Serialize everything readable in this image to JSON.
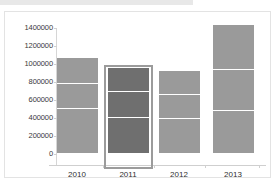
{
  "window": {
    "top_band_label": ""
  },
  "chart_data": {
    "type": "bar",
    "stacked": true,
    "title": "",
    "subtitle": "",
    "xlabel": "",
    "ylabel": "",
    "categories": [
      "2010",
      "2011",
      "2012",
      "2013"
    ],
    "ytick_labels": [
      "1400000",
      "1200000",
      "1000000",
      "800000",
      "600000",
      "400000",
      "200000",
      "0"
    ],
    "ytick_values": [
      1400000,
      1200000,
      1000000,
      800000,
      600000,
      400000,
      200000,
      0
    ],
    "ylim": [
      0,
      1400000
    ],
    "grid": false,
    "legend": "none",
    "series": [
      {
        "name": "segment-1",
        "values": [
          490000,
          385000,
          380000,
          465000
        ]
      },
      {
        "name": "segment-2",
        "values": [
          280000,
          295000,
          265000,
          455000
        ]
      },
      {
        "name": "segment-3",
        "values": [
          290000,
          270000,
          265000,
          500000
        ]
      }
    ],
    "totals": [
      1060000,
      950000,
      910000,
      1420000
    ],
    "selected_category": "2011",
    "colors": {
      "bar_fill": "#9a9a9a",
      "bar_fill_selected": "#6f6f6f",
      "segment_divider": "#ffffff",
      "selection_border": "#9b9b9b",
      "axis_line": "#d0d0d0",
      "tick_text": "#333333",
      "panel_background": "#ffffff",
      "panel_border": "#e3e3e3"
    }
  }
}
